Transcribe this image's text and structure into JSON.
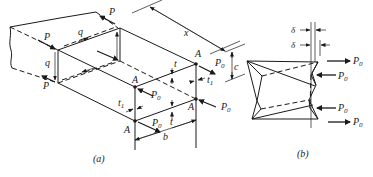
{
  "figure": {
    "panel_a": {
      "caption": "(a)",
      "labels": {
        "P": "P",
        "q": "q",
        "x": "x",
        "A": "A",
        "P0": "P",
        "P0_sub": "0",
        "t": "t",
        "t1": "t",
        "t1_sub": "1",
        "b": "b",
        "c": "c"
      }
    },
    "panel_b": {
      "caption": "(b)",
      "labels": {
        "delta": "δ",
        "P0": "P",
        "P0_sub": "0"
      }
    }
  }
}
